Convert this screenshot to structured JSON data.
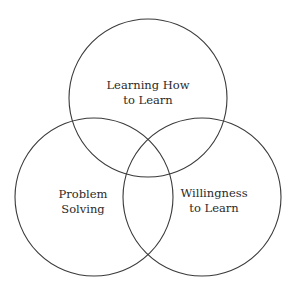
{
  "diagram": {
    "type": "venn",
    "sets": [
      {
        "id": "top",
        "label_lines": [
          "Learning How",
          "to Learn"
        ]
      },
      {
        "id": "left",
        "label_lines": [
          "Problem",
          "Solving"
        ]
      },
      {
        "id": "right",
        "label_lines": [
          "Willingness",
          "to Learn"
        ]
      }
    ]
  }
}
